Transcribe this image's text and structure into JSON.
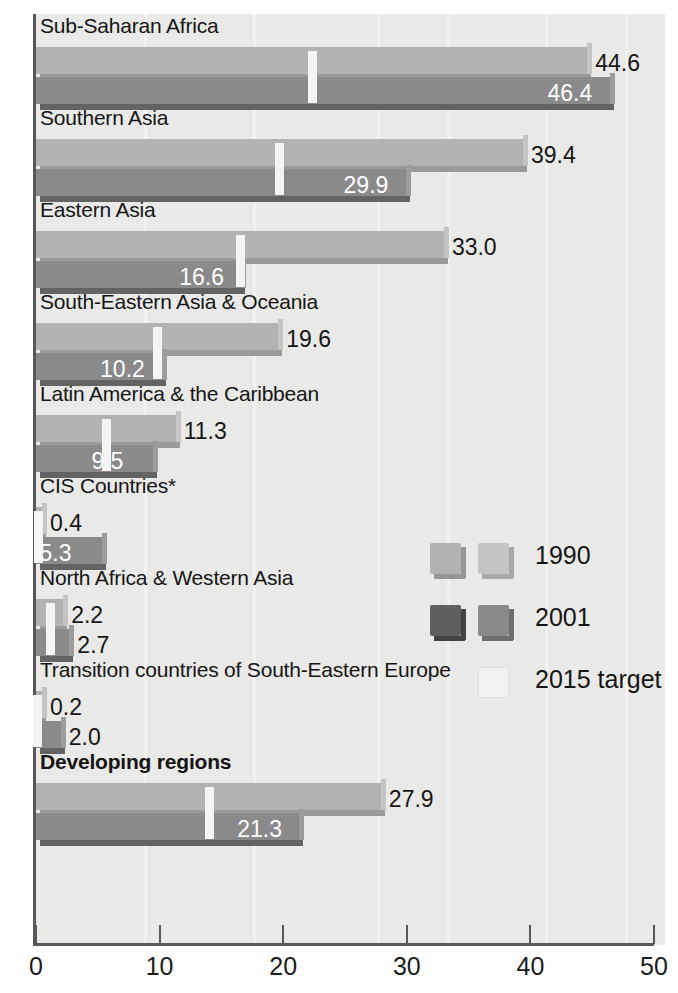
{
  "chart_data": {
    "type": "bar",
    "orientation": "horizontal",
    "title": "",
    "subtitle": "",
    "xlabel": "",
    "ylabel": "",
    "xlim": [
      0,
      50
    ],
    "xticks": [
      0,
      10,
      20,
      30,
      40,
      50
    ],
    "xtick_labels": [
      "0",
      "10",
      "20",
      "30",
      "40",
      "50"
    ],
    "grid": false,
    "legend_position": "middle-right",
    "categories": [
      "Sub-Saharan Africa",
      "Southern Asia",
      "Eastern Asia",
      "South-Eastern Asia & Oceania",
      "Latin America & the Caribbean",
      "CIS Countries*",
      "North Africa & Western Asia",
      "Transition countries of South-Eastern Europe",
      "Developing regions"
    ],
    "series": [
      {
        "name": "1990",
        "color": "#b2b2b2",
        "values": [
          44.6,
          39.4,
          33.0,
          19.6,
          11.3,
          0.4,
          2.2,
          0.2,
          27.9
        ],
        "value_labels": [
          "44.6",
          "39.4",
          "33.0",
          "19.6",
          "11.3",
          "0.4",
          "2.2",
          "0.2",
          "27.9"
        ]
      },
      {
        "name": "2001",
        "color": "#8a8a8a",
        "values": [
          46.4,
          29.9,
          16.6,
          10.2,
          9.5,
          5.3,
          2.7,
          2.0,
          21.3
        ],
        "value_labels": [
          "46.4",
          "29.9",
          "16.6",
          "10.2",
          "9.5",
          "5.3",
          "2.7",
          "2.0",
          "21.3"
        ]
      },
      {
        "name": "2015 target",
        "color": "#f4f4f2",
        "marker": "vertical-tick",
        "values": [
          22.3,
          19.7,
          16.5,
          9.8,
          5.7,
          0.2,
          1.1,
          0.1,
          14.0
        ],
        "value_labels": [
          "",
          "",
          "",
          "",
          "",
          "",
          "",
          "",
          ""
        ]
      }
    ],
    "legend_entries": [
      {
        "label": "1990",
        "swatch_primary": "#b2b2b2",
        "swatch_secondary": "#c4c4c4"
      },
      {
        "label": "2001",
        "swatch_primary": "#5f5f5f",
        "swatch_secondary": "#8a8a8a"
      },
      {
        "label": "2015 target",
        "swatch_primary": "#f2f2f0",
        "swatch_secondary": "#f2f2f0"
      }
    ]
  },
  "style": {
    "background": "#e9e9e7",
    "axis_color": "#58585a",
    "text_color": "#151515",
    "inside_label_color": "#ffffff"
  }
}
